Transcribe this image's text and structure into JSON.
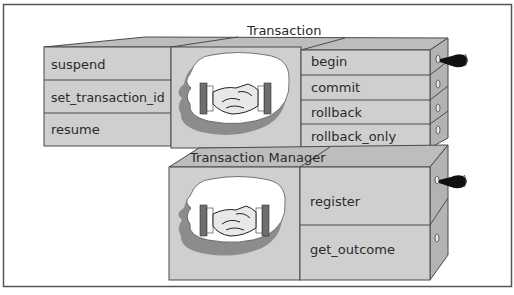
{
  "colors": {
    "face": "#cfcfcf",
    "top_face": "#bdbdbd",
    "side_face": "#b3b3b3",
    "line": "#4a4a4a",
    "cloud": "#ffffff",
    "cloud_shadow": "#8c8c8c",
    "handle": "#111111"
  },
  "transaction": {
    "title": "Transaction",
    "left_ops": [
      "suspend",
      "set_transaction_id",
      "resume"
    ],
    "right_ops": [
      "begin",
      "commit",
      "rollback",
      "rollback_only"
    ],
    "icon": "handshake-icon",
    "handle_icon": "drawer-handle-icon"
  },
  "transaction_manager": {
    "title": "Transaction Manager",
    "right_ops": [
      "register",
      "get_outcome"
    ],
    "icon": "handshake-icon",
    "handle_icon": "drawer-handle-icon"
  }
}
